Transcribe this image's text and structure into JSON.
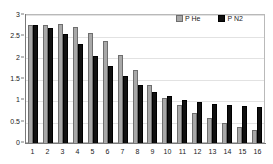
{
  "chart_data": {
    "type": "bar",
    "title": "",
    "subtitle": "",
    "xlabel": "",
    "ylabel": "",
    "categories": [
      "1",
      "2",
      "3",
      "4",
      "5",
      "6",
      "7",
      "8",
      "9",
      "10",
      "11",
      "12",
      "13",
      "14",
      "15",
      "16"
    ],
    "series": [
      {
        "name": "P He",
        "color": "#a8a8a8",
        "values": [
          2.77,
          2.77,
          2.78,
          2.72,
          2.58,
          2.38,
          2.06,
          1.71,
          1.35,
          1.06,
          0.89,
          0.71,
          0.58,
          0.47,
          0.37,
          0.3
        ]
      },
      {
        "name": "P N2",
        "color": "#101010",
        "values": [
          2.77,
          2.7,
          2.55,
          2.32,
          2.04,
          1.8,
          1.56,
          1.37,
          1.2,
          1.1,
          1.01,
          0.96,
          0.92,
          0.89,
          0.86,
          0.84
        ]
      }
    ],
    "ylim": [
      0,
      3
    ],
    "yticks": [
      "0",
      "0.5",
      "1",
      "1.5",
      "2",
      "2.5",
      "3"
    ],
    "ytick_values": [
      0,
      0.5,
      1,
      1.5,
      2,
      2.5,
      3
    ],
    "grid": true,
    "grid_axis": "y",
    "legend_position": "top-right",
    "annotations": []
  },
  "legend": {
    "items": [
      {
        "label": "P He",
        "swatch": "he-swatch-icon"
      },
      {
        "label": "P N2",
        "swatch": "n2-swatch-icon"
      }
    ]
  },
  "colors": {
    "he": "#a8a8a8",
    "n2": "#101010",
    "frame": "#b9b9b9",
    "grid": "#e2e2e2",
    "axis": "#7a7a7a",
    "background": "#ffffff",
    "text": "#222222"
  }
}
